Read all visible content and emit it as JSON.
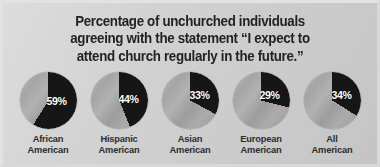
{
  "figure": {
    "title_lines": [
      "Percentage of unchurched individuals",
      "agreeing with the statement “I expect to",
      "attend church regularly in the future.”"
    ],
    "background_color": "#cdcdcd",
    "title_color": "#232323",
    "slice_dark_color": "#161616",
    "slice_light_color": "#a8a8a8",
    "pct_label_color": "#ffffff"
  },
  "chart_data": {
    "type": "pie",
    "title": "Percentage of unchurched individuals agreeing with the statement “I expect to attend church regularly in the future.”",
    "xlabel": "",
    "ylabel": "",
    "legend": [],
    "grid": false,
    "units": "percent",
    "note": "Five separate pie charts; the dark slice shows the percentage agreeing, starting at 12 o'clock clockwise.",
    "categories": [
      "African American",
      "Hispanic American",
      "Asian American",
      "European American",
      "All American"
    ],
    "values": [
      59,
      44,
      33,
      29,
      34
    ],
    "value_labels": [
      "59%",
      "44%",
      "33%",
      "29%",
      "34%"
    ],
    "charts": [
      {
        "group_line1": "African",
        "group_line2": "American",
        "value": 59,
        "value_label": "59%",
        "remainder": 41,
        "label_x": 27,
        "label_y": 24
      },
      {
        "group_line1": "Hispanic",
        "group_line2": "American",
        "value": 44,
        "value_label": "44%",
        "remainder": 56,
        "label_x": 28,
        "label_y": 22
      },
      {
        "group_line1": "Asian",
        "group_line2": "American",
        "value": 33,
        "value_label": "33%",
        "remainder": 67,
        "label_x": 28,
        "label_y": 18
      },
      {
        "group_line1": "European",
        "group_line2": "American",
        "value": 29,
        "value_label": "29%",
        "remainder": 71,
        "label_x": 27,
        "label_y": 18
      },
      {
        "group_line1": "All",
        "group_line2": "American",
        "value": 34,
        "value_label": "34%",
        "remainder": 66,
        "label_x": 28,
        "label_y": 18
      }
    ]
  }
}
